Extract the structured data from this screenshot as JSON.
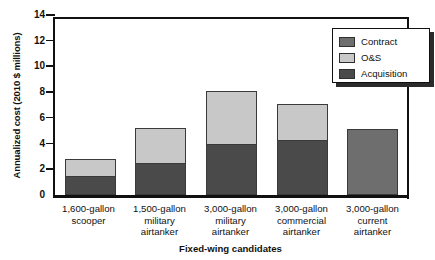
{
  "chart_data": {
    "type": "bar",
    "subtype": "stacked-vertical",
    "title": "",
    "xlabel": "Fixed-wing candidates",
    "ylabel": "Annualized cost (2010 $ millions)",
    "ylim": [
      0,
      14
    ],
    "yticks": [
      0,
      2,
      4,
      6,
      8,
      10,
      12,
      14
    ],
    "grid": false,
    "legend_position": "top-right",
    "categories": [
      "1,600-gallon scooper",
      "1,500-gallon military airtanker",
      "3,000-gallon military airtanker",
      "3,000-gallon commercial airtanker",
      "3,000-gallon current airtanker"
    ],
    "category_lines": [
      [
        "1,600-gallon",
        "scooper"
      ],
      [
        "1,500-gallon",
        "military",
        "airtanker"
      ],
      [
        "3,000-gallon",
        "military",
        "airtanker"
      ],
      [
        "3,000-gallon",
        "commercial",
        "airtanker"
      ],
      [
        "3,000-gallon",
        "current",
        "airtanker"
      ]
    ],
    "series": [
      {
        "name": "Acquisition",
        "color": "#4a4a4a",
        "values": [
          1.5,
          2.5,
          3.95,
          4.3,
          0
        ]
      },
      {
        "name": "O&S",
        "color": "#c8c8c8",
        "values": [
          1.3,
          2.7,
          4.15,
          2.75,
          0
        ]
      },
      {
        "name": "Contract",
        "color": "#6e6e6e",
        "values": [
          0,
          0,
          0,
          0,
          5.15
        ]
      }
    ],
    "totals": [
      2.8,
      5.2,
      8.1,
      7.05,
      5.15
    ],
    "legend_order": [
      "Contract",
      "O&S",
      "Acquisition"
    ],
    "axis_color": "#111111",
    "background": "#ffffff"
  },
  "legend": {
    "items": [
      {
        "label": "Contract",
        "color": "#6e6e6e"
      },
      {
        "label": "O&S",
        "color": "#c8c8c8"
      },
      {
        "label": "Acquisition",
        "color": "#4a4a4a"
      }
    ]
  }
}
